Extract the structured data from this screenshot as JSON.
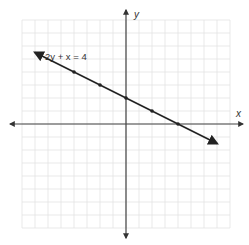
{
  "chart_data": {
    "type": "line",
    "title": "",
    "xlabel": "x",
    "ylabel": "y",
    "grid": true,
    "xlim": [
      -8,
      8
    ],
    "ylim": [
      -8,
      8
    ],
    "series": [
      {
        "name": "2y + x = 4",
        "equation": "2y + x = 4",
        "x": [
          -4,
          -2,
          0,
          2,
          4
        ],
        "y": [
          4,
          3,
          2,
          1,
          0
        ],
        "marked_points": [
          [
            -4,
            4
          ],
          [
            -2,
            3
          ],
          [
            0,
            2
          ],
          [
            2,
            1
          ],
          [
            4,
            0
          ]
        ],
        "arrow_ends": [
          [
            -7,
            5.5
          ],
          [
            7,
            -1.5
          ]
        ]
      }
    ],
    "annotations": [
      {
        "text": "2y + x = 4",
        "position": [
          -7,
          6.3
        ]
      }
    ]
  },
  "labels": {
    "x_axis": "x",
    "y_axis": "y",
    "equation": "2y + x = 4"
  },
  "colors": {
    "grid": "#e3e3e3",
    "axis": "#444444",
    "line": "#222222"
  }
}
